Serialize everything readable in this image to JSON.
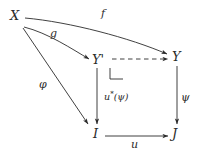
{
  "diagram": {
    "kind": "commutative-diagram",
    "background_color": "#ffffff",
    "ink_color": "#2b2b2b",
    "nodes": [
      {
        "id": "X",
        "label": "X",
        "x": 14,
        "y": 16
      },
      {
        "id": "Yprime",
        "label": "Y'",
        "x": 99,
        "y": 61
      },
      {
        "id": "Y",
        "label": "Y",
        "x": 177,
        "y": 57
      },
      {
        "id": "I",
        "label": "I",
        "x": 96,
        "y": 133
      },
      {
        "id": "J",
        "label": "J",
        "x": 176,
        "y": 133
      }
    ],
    "edges": [
      {
        "id": "f",
        "from": "X",
        "to": "Y",
        "label": "f",
        "style": "solid",
        "shape": "curved"
      },
      {
        "id": "g",
        "from": "X",
        "to": "Yprime",
        "label": "g",
        "style": "solid",
        "shape": "curved"
      },
      {
        "id": "phi",
        "from": "X",
        "to": "I",
        "label": "φ",
        "style": "solid",
        "shape": "straight"
      },
      {
        "id": "top",
        "from": "Yprime",
        "to": "Y",
        "label": "",
        "style": "dashed",
        "shape": "straight"
      },
      {
        "id": "ustar",
        "from": "Yprime",
        "to": "I",
        "label": "u*(ψ)",
        "style": "solid",
        "shape": "straight"
      },
      {
        "id": "psi",
        "from": "Y",
        "to": "J",
        "label": "ψ",
        "style": "solid",
        "shape": "straight"
      },
      {
        "id": "u",
        "from": "I",
        "to": "J",
        "label": "u",
        "style": "solid",
        "shape": "straight"
      }
    ],
    "labels": {
      "f": "f",
      "g": "g",
      "phi": "φ",
      "psi": "ψ",
      "u": "u",
      "u_pullback_base": "u",
      "u_pullback_sup": "*",
      "u_pullback_arg": "(ψ)",
      "X": "X",
      "Yprime": "Y'",
      "Y": "Y",
      "I": "I",
      "J": "J"
    },
    "markers": [
      {
        "id": "pullback-corner",
        "name": "pullback-square-marker",
        "x": 110,
        "y": 68
      }
    ]
  }
}
